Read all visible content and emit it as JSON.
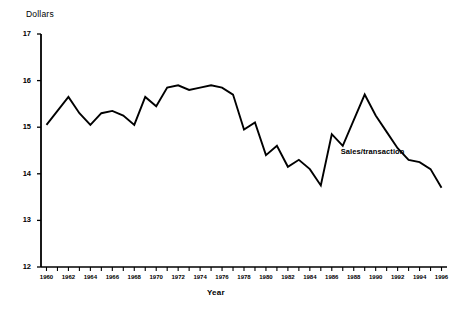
{
  "chart_data": {
    "type": "line",
    "title": "",
    "xlabel": "Year",
    "ylabel": "Dollars",
    "xlim": [
      1959.5,
      1996.5
    ],
    "ylim": [
      12,
      17
    ],
    "grid": false,
    "legend_position": "inline-annotation",
    "y_ticks": [
      12,
      13,
      14,
      15,
      16,
      17
    ],
    "y_tick_labels": [
      "12",
      "13",
      "14",
      "15",
      "16",
      "17"
    ],
    "x_ticks": [
      1960,
      1961,
      1962,
      1963,
      1964,
      1965,
      1966,
      1967,
      1968,
      1969,
      1970,
      1971,
      1972,
      1973,
      1974,
      1975,
      1976,
      1977,
      1978,
      1979,
      1980,
      1981,
      1982,
      1983,
      1984,
      1985,
      1986,
      1987,
      1988,
      1989,
      1990,
      1991,
      1992,
      1993,
      1994,
      1995,
      1996
    ],
    "x_tick_labels": [
      "1960",
      "1962",
      "1964",
      "1966",
      "1968",
      "1970",
      "1972",
      "1974",
      "1976",
      "1978",
      "1980",
      "1982",
      "1984",
      "1986",
      "1988",
      "1990",
      "1992",
      "1994",
      "1996"
    ],
    "x_labeled_ticks": [
      1960,
      1962,
      1964,
      1966,
      1968,
      1970,
      1972,
      1974,
      1976,
      1978,
      1980,
      1982,
      1984,
      1986,
      1988,
      1990,
      1992,
      1994,
      1996
    ],
    "annotations": [
      {
        "text": "Sales/transaction",
        "x": 1990,
        "y": 14.45
      }
    ],
    "series": [
      {
        "name": "Sales/transaction",
        "color": "#000000",
        "x": [
          1960,
          1961,
          1962,
          1963,
          1964,
          1965,
          1966,
          1967,
          1968,
          1969,
          1970,
          1971,
          1972,
          1973,
          1974,
          1975,
          1976,
          1977,
          1978,
          1979,
          1980,
          1981,
          1982,
          1983,
          1984,
          1985,
          1986,
          1987,
          1988,
          1989,
          1990,
          1991,
          1992,
          1993,
          1994,
          1995,
          1996
        ],
        "values": [
          15.05,
          15.35,
          15.65,
          15.3,
          15.05,
          15.3,
          15.35,
          15.25,
          15.05,
          15.65,
          15.45,
          15.85,
          15.9,
          15.8,
          15.85,
          15.9,
          15.85,
          15.7,
          14.95,
          15.1,
          14.4,
          14.6,
          14.15,
          14.3,
          14.1,
          13.75,
          14.85,
          14.6,
          15.15,
          15.7,
          15.25,
          14.9,
          14.55,
          14.3,
          14.25,
          14.1,
          13.7
        ]
      }
    ]
  },
  "chart_line_points": {
    "comment": "",
    "pixel_path": ""
  },
  "labels": {
    "dollars": "Dollars",
    "year": "Year",
    "series_annotation": "Sales/transaction"
  }
}
